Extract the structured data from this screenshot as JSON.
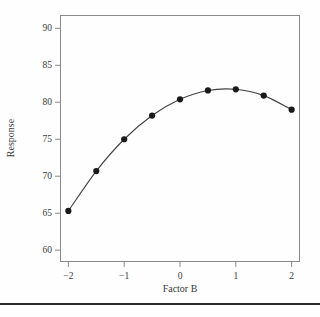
{
  "figure": {
    "background_color": "#fefefe",
    "frame_color": "#8a8a8a",
    "rule_color": "#2b2b2b"
  },
  "chart_data": {
    "type": "line",
    "title": "",
    "subtitle": "",
    "xlabel": "Factor B",
    "ylabel": "Response",
    "x": [
      -2,
      -1.5,
      -1,
      -0.5,
      0,
      0.5,
      1,
      1.5,
      2
    ],
    "values": [
      65.3,
      70.7,
      75.0,
      78.2,
      80.4,
      81.6,
      81.75,
      80.9,
      79.0
    ],
    "series": [
      {
        "name": "Response",
        "values": [
          65.3,
          70.7,
          75.0,
          78.2,
          80.4,
          81.6,
          81.75,
          80.9,
          79.0
        ],
        "line_color": "#404040",
        "marker_color": "#1a1a1a",
        "marker": "circle"
      }
    ],
    "xlim": [
      -2.15,
      2.15
    ],
    "ylim": [
      58.4,
      91.8
    ],
    "xticks": [
      -2,
      -1,
      0,
      1,
      2
    ],
    "xticklabels": [
      "−2",
      "−1",
      "0",
      "1",
      "2"
    ],
    "yticks": [
      60,
      65,
      70,
      75,
      80,
      85,
      90
    ],
    "yticklabels": [
      "60",
      "65",
      "70",
      "75",
      "80",
      "85",
      "90"
    ],
    "grid": false,
    "legend": false,
    "legend_position": "none",
    "annotations": []
  },
  "axes": {
    "x_title": "Factor B",
    "y_title": "Response"
  }
}
